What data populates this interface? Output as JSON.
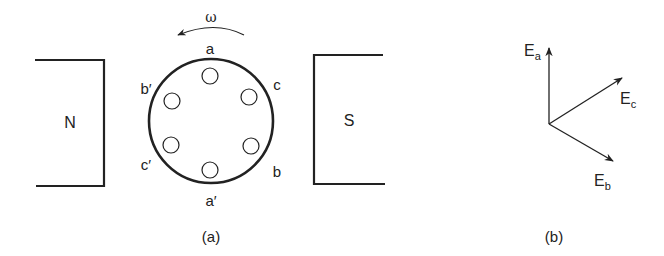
{
  "figure_a": {
    "caption": "(a)",
    "north_pole_label": "N",
    "south_pole_label": "S",
    "rotation_label": "ω",
    "conductor_labels": {
      "a": "a",
      "a_prime": "a′",
      "b": "b",
      "b_prime": "b′",
      "c": "c",
      "c_prime": "c′"
    },
    "conductor_count": 6
  },
  "figure_b": {
    "caption": "(b)",
    "phasors": [
      {
        "name": "E",
        "sub": "a",
        "direction": "up"
      },
      {
        "name": "E",
        "sub": "c",
        "direction": "up-right"
      },
      {
        "name": "E",
        "sub": "b",
        "direction": "down-right"
      }
    ]
  },
  "colors": {
    "line": "#222222",
    "background": "#ffffff"
  }
}
